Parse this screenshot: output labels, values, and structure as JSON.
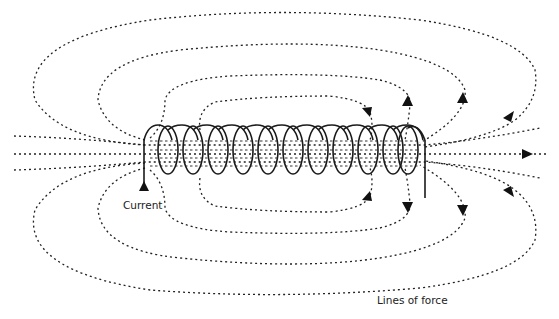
{
  "diagram": {
    "type": "solenoid-magnetic-field",
    "labels": {
      "current": "Current",
      "lines_of_force": "Lines of force"
    },
    "colors": {
      "background": "#ffffff",
      "stroke": "#1a1a1a"
    },
    "coil_turns": 11
  }
}
